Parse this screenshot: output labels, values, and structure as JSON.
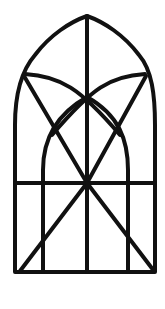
{
  "image": {
    "subject": "gothic-arch-window-tracery",
    "width": 165,
    "height": 309,
    "background": "#ffffff",
    "stroke_color": "#111111",
    "stroke_width": 4
  }
}
